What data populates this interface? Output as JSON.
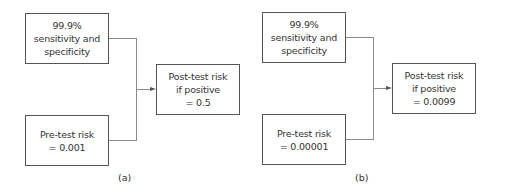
{
  "panels": [
    {
      "id": "a",
      "label": "(a)",
      "input_test": {
        "lines": [
          "99.9%",
          "sensitivity and",
          "specificity"
        ]
      },
      "input_pretest": {
        "lines": [
          "Pre-test risk",
          "= 0.001"
        ]
      },
      "output": {
        "lines": [
          "Post-test risk",
          "if positive",
          "= 0.5"
        ]
      }
    },
    {
      "id": "b",
      "label": "(b)",
      "input_test": {
        "lines": [
          "99.9%",
          "sensitivity and",
          "specificity"
        ]
      },
      "input_pretest": {
        "lines": [
          "Pre-test risk",
          "= 0.00001"
        ]
      },
      "output": {
        "lines": [
          "Post-test risk",
          "if positive",
          "= 0.0099"
        ]
      }
    }
  ],
  "colors": {
    "box_border": "#555555",
    "connector": "#8a8a8a",
    "text": "#333333"
  }
}
